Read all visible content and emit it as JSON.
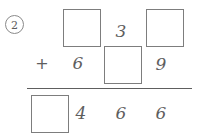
{
  "worksheet": {
    "problem_number": "2",
    "operator": "+",
    "rows": {
      "addend_top": {
        "cells": [
          {
            "kind": "blank-box",
            "value": ""
          },
          {
            "kind": "digit",
            "value": "6"
          },
          {
            "kind": "digit",
            "value": "3"
          },
          {
            "kind": "blank-box",
            "value": ""
          },
          {
            "kind": "blank-box",
            "value": ""
          },
          {
            "kind": "digit",
            "value": "9"
          }
        ]
      },
      "sum": {
        "cells": [
          {
            "kind": "blank-box",
            "value": ""
          },
          {
            "kind": "digit",
            "value": "4"
          },
          {
            "kind": "digit",
            "value": "6"
          },
          {
            "kind": "digit",
            "value": "6"
          }
        ]
      }
    },
    "digits": {
      "top_six": "6",
      "top_three": "3",
      "top_nine": "9",
      "sum_four": "4",
      "sum_six_first": "6",
      "sum_six_second": "6"
    },
    "colors": {
      "ink": "#5e5e5e",
      "box_border": "#7d7d7d",
      "rule": "#5e5e5e",
      "background": "#ffffff"
    }
  }
}
